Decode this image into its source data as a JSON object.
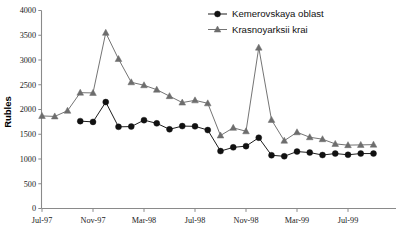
{
  "chart_data": {
    "type": "line",
    "title": "",
    "xlabel": "",
    "ylabel": "Rubles",
    "ylim": [
      0,
      4000
    ],
    "ytick_step": 500,
    "yticks": [
      0,
      500,
      1000,
      1500,
      2000,
      2500,
      3000,
      3500,
      4000
    ],
    "grid": false,
    "legend_position": "top-right",
    "x": [
      "Jul-97",
      "Aug-97",
      "Sep-97",
      "Oct-97",
      "Nov-97",
      "Dec-97",
      "Jan-98",
      "Feb-98",
      "Mar-98",
      "Apr-98",
      "May-98",
      "Jun-98",
      "Jul-98",
      "Aug-98",
      "Sep-98",
      "Oct-98",
      "Nov-98",
      "Dec-98",
      "Jan-99",
      "Feb-99",
      "Mar-99",
      "Apr-99",
      "May-99",
      "Jun-99",
      "Jul-99",
      "Aug-99",
      "Sep-99"
    ],
    "xtick_labels": [
      "Jul-97",
      "Nov-97",
      "Mar-98",
      "Jul-98",
      "Nov-98",
      "Mar-99",
      "Jul-99"
    ],
    "series": [
      {
        "name": "Kemerovskaya oblast",
        "marker": "circle",
        "color": "#111111",
        "values": [
          null,
          null,
          null,
          1765,
          1750,
          2150,
          1650,
          1655,
          1785,
          1720,
          1600,
          1665,
          1660,
          1585,
          1160,
          1235,
          1260,
          1430,
          1075,
          1055,
          1150,
          1130,
          1080,
          1110,
          1085,
          1110,
          1110
        ]
      },
      {
        "name": "Krasnoyarksii krai",
        "marker": "triangle",
        "color": "#6d6d6d",
        "values": [
          1870,
          1860,
          1975,
          2340,
          2335,
          3550,
          3020,
          2550,
          2490,
          2400,
          2270,
          2140,
          2185,
          2125,
          1475,
          1630,
          1560,
          3250,
          1790,
          1370,
          1540,
          1440,
          1400,
          1305,
          1280,
          1285,
          1290
        ]
      }
    ]
  },
  "legend": {
    "items": [
      {
        "label": "Kemerovskaya oblast"
      },
      {
        "label": "Krasnoyarksii krai"
      }
    ]
  },
  "colors": {
    "series_a": "#111111",
    "series_b": "#6d6d6d",
    "axis": "#8a8a8a",
    "background": "#ffffff"
  }
}
